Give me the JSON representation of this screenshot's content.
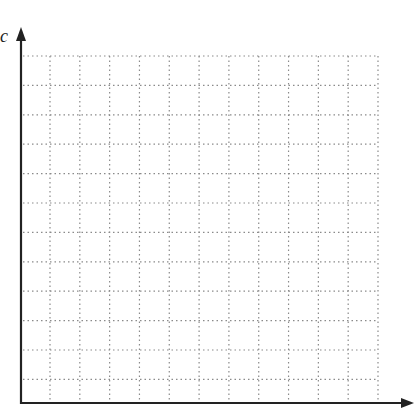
{
  "chart_data": {
    "type": "scatter",
    "title": "",
    "xlabel": "",
    "ylabel": "c",
    "grid": true,
    "grid_style": "dotted",
    "x_gridlines": 12,
    "y_gridlines": 12,
    "series": [],
    "colors": {
      "axis": "#222222",
      "grid": "#888888",
      "background": "#ffffff"
    }
  },
  "axes": {
    "y_label": "c",
    "x_label": ""
  }
}
